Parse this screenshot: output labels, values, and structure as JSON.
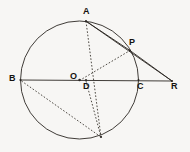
{
  "diagram": {
    "background_color": "#f7f6f4",
    "stroke_color": "#2b2723",
    "label_color": "#15120f",
    "circle": {
      "center_label": "O",
      "cx": 79.5,
      "cy": 80,
      "r": 59
    },
    "labels": [
      {
        "name": "A",
        "text": "A",
        "x": 83,
        "y": 7
      },
      {
        "name": "P",
        "text": "P",
        "x": 129,
        "y": 38
      },
      {
        "name": "B",
        "text": "B",
        "x": 9,
        "y": 74
      },
      {
        "name": "O",
        "text": "O",
        "x": 70,
        "y": 72
      },
      {
        "name": "D",
        "text": "D",
        "x": 83,
        "y": 82
      },
      {
        "name": "C",
        "text": "C",
        "x": 137,
        "y": 82
      },
      {
        "name": "R",
        "text": "R",
        "x": 171,
        "y": 82
      }
    ],
    "points": [
      {
        "name": "A",
        "x": 86,
        "y": 21.2
      },
      {
        "name": "B",
        "x": 20.5,
        "y": 80
      },
      {
        "name": "C",
        "x": 138.5,
        "y": 80
      },
      {
        "name": "O",
        "x": 79.5,
        "y": 80
      },
      {
        "name": "D",
        "x": 86,
        "y": 80
      },
      {
        "name": "P",
        "x": 130,
        "y": 50.5
      },
      {
        "name": "R",
        "x": 172,
        "y": 81
      },
      {
        "name": "Q",
        "x": 101,
        "y": 137
      }
    ],
    "solid_segments": [
      {
        "name": "segment-B-R",
        "from": "B",
        "to": "R",
        "x1": 20.5,
        "y1": 80,
        "x2": 172,
        "y2": 81
      },
      {
        "name": "segment-A-P",
        "from": "A",
        "to": "P",
        "x1": 86,
        "y1": 21.2,
        "x2": 130,
        "y2": 50.5
      },
      {
        "name": "segment-P-R",
        "from": "P",
        "to": "R",
        "x1": 130,
        "y1": 50.5,
        "x2": 172,
        "y2": 81
      },
      {
        "name": "segment-A-R",
        "from": "A",
        "to": "R",
        "x1": 86,
        "y1": 21.2,
        "x2": 172,
        "y2": 81
      }
    ],
    "dashed_segments": [
      {
        "name": "segment-A-Q",
        "from": "A",
        "to": "Q",
        "x1": 86,
        "y1": 21.2,
        "x2": 101,
        "y2": 137
      },
      {
        "name": "segment-O-P",
        "from": "O",
        "to": "P",
        "x1": 79.5,
        "y1": 80.5,
        "x2": 130,
        "y2": 50.5
      },
      {
        "name": "segment-B-Q",
        "from": "B",
        "to": "Q",
        "x1": 21.5,
        "y1": 81,
        "x2": 101,
        "y2": 137
      },
      {
        "name": "segment-D-Q",
        "from": "D",
        "to": "Q",
        "x1": 86,
        "y1": 81,
        "x2": 101,
        "y2": 137
      }
    ]
  }
}
